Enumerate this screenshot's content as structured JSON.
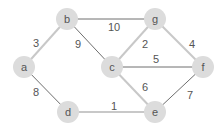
{
  "diagram": {
    "type": "weighted-undirected-graph",
    "colors": {
      "node_fill": "#dcdcdc",
      "edge_light": "#c8c8c8",
      "edge_dark": "#6e6e6e",
      "text": "#555555"
    },
    "nodes": [
      {
        "id": "a",
        "label": "a",
        "x": 24,
        "y": 67
      },
      {
        "id": "b",
        "label": "b",
        "x": 67,
        "y": 19
      },
      {
        "id": "c",
        "label": "c",
        "x": 112,
        "y": 67
      },
      {
        "id": "d",
        "label": "d",
        "x": 68,
        "y": 112
      },
      {
        "id": "e",
        "label": "e",
        "x": 155,
        "y": 112
      },
      {
        "id": "f",
        "label": "f",
        "x": 203,
        "y": 67
      },
      {
        "id": "g",
        "label": "g",
        "x": 155,
        "y": 19
      }
    ],
    "edges": [
      {
        "from": "a",
        "to": "b",
        "weight": "3",
        "style": "light",
        "label_x": 36,
        "label_y": 43
      },
      {
        "from": "b",
        "to": "g",
        "weight": "10",
        "style": "dark",
        "label_x": 114,
        "label_y": 27
      },
      {
        "from": "b",
        "to": "c",
        "weight": "9",
        "style": "dark",
        "label_x": 78,
        "label_y": 44
      },
      {
        "from": "a",
        "to": "d",
        "weight": "8",
        "style": "dark",
        "label_x": 36,
        "label_y": 92
      },
      {
        "from": "c",
        "to": "g",
        "weight": "2",
        "style": "light",
        "label_x": 145,
        "label_y": 44
      },
      {
        "from": "g",
        "to": "f",
        "weight": "4",
        "style": "light",
        "label_x": 192,
        "label_y": 44
      },
      {
        "from": "c",
        "to": "f",
        "weight": "5",
        "style": "dark",
        "label_x": 156,
        "label_y": 59
      },
      {
        "from": "c",
        "to": "e",
        "weight": "6",
        "style": "light",
        "label_x": 145,
        "label_y": 87
      },
      {
        "from": "d",
        "to": "e",
        "weight": "1",
        "style": "light",
        "label_x": 114,
        "label_y": 106
      },
      {
        "from": "e",
        "to": "f",
        "weight": "7",
        "style": "dark",
        "label_x": 190,
        "label_y": 95
      }
    ]
  }
}
